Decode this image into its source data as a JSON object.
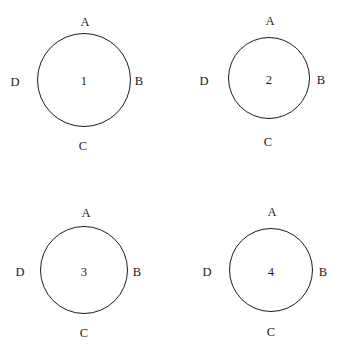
{
  "figure": {
    "type": "diagram",
    "background_color": "#ffffff",
    "stroke_color": "#1b1b1b",
    "text_color": "#1b1b1b",
    "canvas": {
      "width": 351,
      "height": 358
    },
    "circles": [
      {
        "id": "circle-1",
        "center_label": "1",
        "cx": 84,
        "cy": 80,
        "r": 47,
        "labels": {
          "top": "A",
          "right": "B",
          "bottom": "C",
          "left": "D"
        },
        "label_positions": {
          "top": {
            "x": 85,
            "y": 22
          },
          "right": {
            "x": 139,
            "y": 81
          },
          "bottom": {
            "x": 83,
            "y": 146
          },
          "left": {
            "x": 15,
            "y": 82
          },
          "center": {
            "x": 84,
            "y": 81
          }
        }
      },
      {
        "id": "circle-2",
        "center_label": "2",
        "cx": 269,
        "cy": 78,
        "r": 41,
        "labels": {
          "top": "A",
          "right": "B",
          "bottom": "C",
          "left": "D"
        },
        "label_positions": {
          "top": {
            "x": 270,
            "y": 21
          },
          "right": {
            "x": 321,
            "y": 80
          },
          "bottom": {
            "x": 268,
            "y": 142
          },
          "left": {
            "x": 204,
            "y": 81
          },
          "center": {
            "x": 269,
            "y": 80
          }
        }
      },
      {
        "id": "circle-3",
        "center_label": "3",
        "cx": 84,
        "cy": 270,
        "r": 44,
        "labels": {
          "top": "A",
          "right": "B",
          "bottom": "C",
          "left": "D"
        },
        "label_positions": {
          "top": {
            "x": 86,
            "y": 213
          },
          "right": {
            "x": 137,
            "y": 272
          },
          "bottom": {
            "x": 84,
            "y": 333
          },
          "left": {
            "x": 20,
            "y": 272
          },
          "center": {
            "x": 84,
            "y": 272
          }
        }
      },
      {
        "id": "circle-4",
        "center_label": "4",
        "cx": 271,
        "cy": 270,
        "r": 42,
        "labels": {
          "top": "A",
          "right": "B",
          "bottom": "C",
          "left": "D"
        },
        "label_positions": {
          "top": {
            "x": 272,
            "y": 212
          },
          "right": {
            "x": 323,
            "y": 272
          },
          "bottom": {
            "x": 271,
            "y": 332
          },
          "left": {
            "x": 207,
            "y": 272
          },
          "center": {
            "x": 271,
            "y": 272
          }
        }
      }
    ]
  }
}
